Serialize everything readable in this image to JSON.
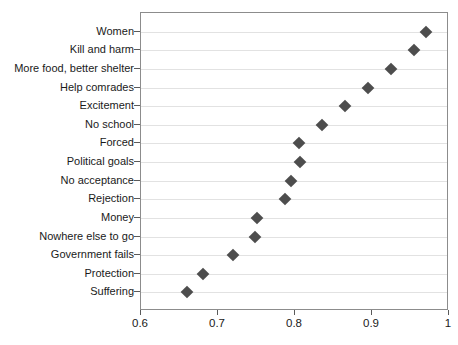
{
  "chart_data": {
    "type": "scatter",
    "title": "",
    "subtitle": "",
    "xlabel": "",
    "ylabel": "",
    "orientation": "horizontal",
    "marker": "diamond",
    "marker_color": "#4d4d4d",
    "grid": "horizontal",
    "legend": "none",
    "xlim": [
      0.6,
      1.0
    ],
    "xticks": [
      "0.6",
      "0.7",
      "0.8",
      "0.9",
      "1"
    ],
    "xtick_values": [
      0.6,
      0.7,
      0.8,
      0.9,
      1.0
    ],
    "categories": [
      "Women",
      "Kill and harm",
      "More food, better shelter",
      "Help comrades",
      "Excitement",
      "No school",
      "Forced",
      "Political goals",
      "No acceptance",
      "Rejection",
      "Money",
      "Nowhere else to go",
      "Government fails",
      "Protection",
      "Suffering"
    ],
    "values": [
      0.97,
      0.955,
      0.925,
      0.895,
      0.865,
      0.835,
      0.805,
      0.807,
      0.795,
      0.787,
      0.75,
      0.748,
      0.72,
      0.68,
      0.66
    ]
  },
  "colors": {
    "marker": "#4d4d4d",
    "gridline": "#e2e2e2",
    "axis": "#8c8c8c",
    "text": "#1a1a1a",
    "background": "#ffffff"
  }
}
